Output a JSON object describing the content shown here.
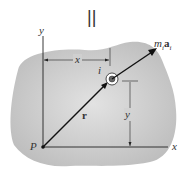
{
  "diagram": {
    "equals_sign": "||",
    "labels": {
      "y_axis": "y",
      "x_axis": "x",
      "origin": "P",
      "x_dim": "x",
      "y_dim": "y",
      "particle": "i",
      "position_vector": "r",
      "force_m": "m",
      "force_sub": "i",
      "force_a": "a",
      "force_a_sub": "i"
    },
    "colors": {
      "body_fill": "#c8c8c8",
      "line": "#111111",
      "background": "#ffffff"
    }
  }
}
